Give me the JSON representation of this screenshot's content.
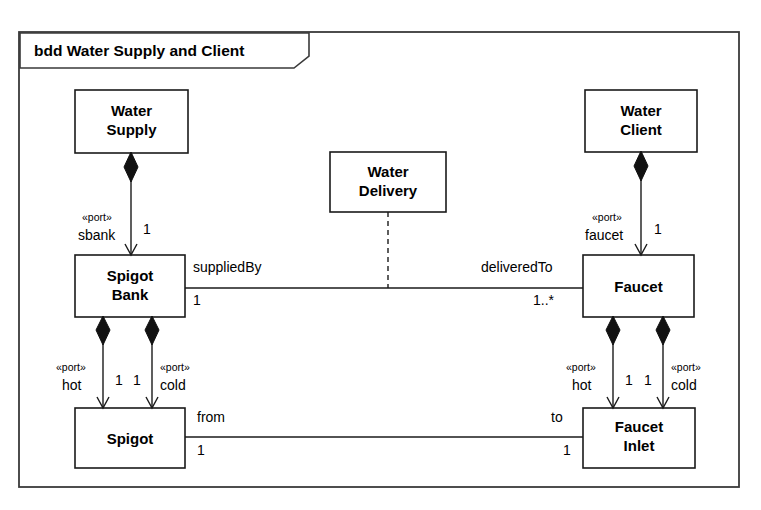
{
  "frame": {
    "tab_label": "bdd Water Supply and Client",
    "diagram_kind": "bdd",
    "diagram_name": "Water Supply and Client"
  },
  "blocks": [
    {
      "id": "water-supply",
      "name_line1": "Water",
      "name_line2": "Supply",
      "x": 75,
      "y": 90,
      "w": 113,
      "h": 63
    },
    {
      "id": "water-delivery",
      "name_line1": "Water",
      "name_line2": "Delivery",
      "x": 330,
      "y": 152,
      "w": 116,
      "h": 60
    },
    {
      "id": "water-client",
      "name_line1": "Water",
      "name_line2": "Client",
      "x": 585,
      "y": 90,
      "w": 112,
      "h": 62
    },
    {
      "id": "spigot-bank",
      "name_line1": "Spigot",
      "name_line2": "Bank",
      "x": 75,
      "y": 255,
      "w": 110,
      "h": 62
    },
    {
      "id": "faucet",
      "name_line1": "Faucet",
      "name_line2": "",
      "x": 583,
      "y": 255,
      "w": 111,
      "h": 62
    },
    {
      "id": "spigot",
      "name_line1": "Spigot",
      "name_line2": "",
      "x": 75,
      "y": 408,
      "w": 110,
      "h": 60
    },
    {
      "id": "faucet-inlet",
      "name_line1": "Faucet",
      "name_line2": "Inlet",
      "x": 583,
      "y": 408,
      "w": 112,
      "h": 60
    }
  ],
  "compositions": [
    {
      "id": "supply-sbank",
      "whole": "Water Supply",
      "part": "Spigot Bank",
      "stereotype": "«port»",
      "port_name": "sbank",
      "multiplicity": "1"
    },
    {
      "id": "client-faucet",
      "whole": "Water Client",
      "part": "Faucet",
      "stereotype": "«port»",
      "port_name": "faucet",
      "multiplicity": "1"
    },
    {
      "id": "spigotbank-hot",
      "whole": "Spigot Bank",
      "part": "Spigot",
      "stereotype": "«port»",
      "port_name": "hot",
      "multiplicity": "1"
    },
    {
      "id": "spigotbank-cold",
      "whole": "Spigot Bank",
      "part": "Spigot",
      "stereotype": "«port»",
      "port_name": "cold",
      "multiplicity": "1"
    },
    {
      "id": "faucet-hot",
      "whole": "Faucet",
      "part": "Faucet Inlet",
      "stereotype": "«port»",
      "port_name": "hot",
      "multiplicity": "1"
    },
    {
      "id": "faucet-cold",
      "whole": "Faucet",
      "part": "Faucet Inlet",
      "stereotype": "«port»",
      "port_name": "cold",
      "multiplicity": "1"
    }
  ],
  "associations": [
    {
      "id": "supplied-delivered",
      "source": "Spigot Bank",
      "target": "Faucet",
      "source_role": "suppliedBy",
      "source_mult": "1",
      "target_role": "deliveredTo",
      "target_mult": "1..*",
      "association_class": "Water Delivery"
    },
    {
      "id": "from-to",
      "source": "Spigot",
      "target": "Faucet Inlet",
      "source_role": "from",
      "source_mult": "1",
      "target_role": "to",
      "target_mult": "1",
      "association_class": ""
    }
  ],
  "colors": {
    "line": "#1a1a1a",
    "frame": "#3a3a3a",
    "fill": "#ffffff",
    "diamond": "#111111"
  }
}
